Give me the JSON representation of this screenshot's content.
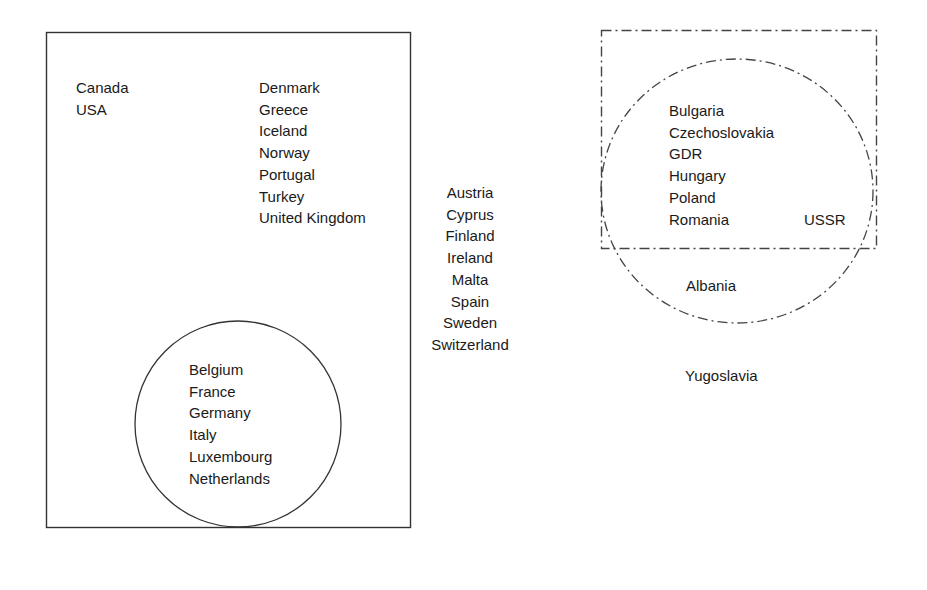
{
  "diagram": {
    "nato_box": {
      "label": "NATO (solid rectangle)",
      "north_america": [
        "Canada",
        "USA"
      ],
      "europe_members": [
        "Denmark",
        "Greece",
        "Iceland",
        "Norway",
        "Portugal",
        "Turkey",
        "United Kingdom"
      ]
    },
    "ec_circle": {
      "label": "EC (solid circle within NATO)",
      "members": [
        "Belgium",
        "France",
        "Germany",
        "Italy",
        "Luxembourg",
        "Netherlands"
      ]
    },
    "neutral": {
      "members": [
        "Austria",
        "Cyprus",
        "Finland",
        "Ireland",
        "Malta",
        "Spain",
        "Sweden",
        "Switzerland"
      ]
    },
    "warsaw_box": {
      "label": "dashed rectangle",
      "members": [
        "Bulgaria",
        "Czechoslovakia",
        "GDR",
        "Hungary",
        "Poland",
        "Romania"
      ],
      "ussr": "USSR"
    },
    "comecon_circle": {
      "label": "dashed circle",
      "outside_box": "Albania"
    },
    "yugoslavia": "Yugoslavia"
  }
}
